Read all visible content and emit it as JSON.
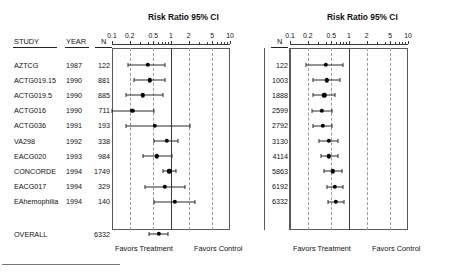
{
  "figure": {
    "kind": "forest-plot",
    "left_panel_title": "Risk Ratio  95%  CI",
    "right_panel_title": "Risk Ratio  95%  CI",
    "favors_treatment_label": "Favors Treatment",
    "favors_control_label": "Favors Control"
  },
  "columns": {
    "study_header": "STUDY",
    "year_header": "YEAR",
    "n_header": "N",
    "n_header_right": "N"
  },
  "axis": {
    "tick_labels": [
      "0.1",
      "0.2",
      "0.5",
      "1",
      "2",
      "5",
      "10"
    ],
    "tick_values": [
      0.1,
      0.2,
      0.5,
      1,
      2,
      5,
      10
    ],
    "scale": "log",
    "min": 0.1,
    "max": 10,
    "gridline_values": [
      0.2,
      0.5,
      2,
      5
    ],
    "null_value": 1,
    "minor_ticks": [
      0.3,
      0.4,
      0.6,
      0.7,
      0.8,
      0.9,
      3,
      4,
      6,
      7,
      8,
      9
    ]
  },
  "overall_label": "OVERALL",
  "chart_data": {
    "type": "forest",
    "title": "Risk Ratio  95%  CI",
    "xlabel": "Risk Ratio",
    "ylabel": "",
    "xscale": "log",
    "xlim": [
      0.1,
      10
    ],
    "grid": true,
    "legend": "none",
    "left_panel": {
      "name": "Individual trials",
      "columns": [
        "STUDY",
        "YEAR",
        "N"
      ],
      "rows": [
        {
          "study": "AZTCG",
          "year": "1987",
          "n": "122",
          "rr": 0.4,
          "lcl": 0.19,
          "ucl": 0.79
        },
        {
          "study": "ACTG019.15",
          "year": "1990",
          "n": "881",
          "rr": 0.44,
          "lcl": 0.24,
          "ucl": 0.8
        },
        {
          "study": "ACTG019.5",
          "year": "1990",
          "n": "885",
          "rr": 0.33,
          "lcl": 0.17,
          "ucl": 0.72
        },
        {
          "study": "ACTG016",
          "year": "1990",
          "n": "711",
          "rr": 0.22,
          "lcl": 0.1,
          "ucl": 0.52
        },
        {
          "study": "ACTG036",
          "year": "1991",
          "n": "193",
          "rr": 0.53,
          "lcl": 0.17,
          "ucl": 2.1
        },
        {
          "study": "VA298",
          "year": "1992",
          "n": "338",
          "rr": 0.85,
          "lcl": 0.52,
          "ucl": 1.3
        },
        {
          "study": "EACG020",
          "year": "1993",
          "n": "984",
          "rr": 0.58,
          "lcl": 0.33,
          "ucl": 1.05
        },
        {
          "study": "CONCORDE",
          "year": "1994",
          "n": "1749",
          "rr": 0.94,
          "lcl": 0.74,
          "ucl": 1.2
        },
        {
          "study": "EACG017",
          "year": "1994",
          "n": "329",
          "rr": 0.78,
          "lcl": 0.36,
          "ucl": 1.72
        },
        {
          "study": "EAhemophilia",
          "year": "1994",
          "n": "140",
          "rr": 1.16,
          "lcl": 0.52,
          "ucl": 2.6
        }
      ],
      "overall": {
        "study": "OVERALL",
        "year": "",
        "n": "6332",
        "rr": 0.62,
        "lcl": 0.43,
        "ucl": 0.88
      }
    },
    "right_panel": {
      "name": "Cumulative meta-analysis",
      "columns": [
        "N"
      ],
      "rows": [
        {
          "n": "122",
          "rr": 0.4,
          "lcl": 0.19,
          "ucl": 0.79
        },
        {
          "n": "1003",
          "rr": 0.42,
          "lcl": 0.25,
          "ucl": 0.7
        },
        {
          "n": "1888",
          "rr": 0.38,
          "lcl": 0.25,
          "ucl": 0.58
        },
        {
          "n": "2599",
          "rr": 0.35,
          "lcl": 0.24,
          "ucl": 0.52
        },
        {
          "n": "2792",
          "rr": 0.36,
          "lcl": 0.25,
          "ucl": 0.52
        },
        {
          "n": "3130",
          "rr": 0.45,
          "lcl": 0.31,
          "ucl": 0.65
        },
        {
          "n": "4114",
          "rr": 0.46,
          "lcl": 0.33,
          "ucl": 0.64
        },
        {
          "n": "5863",
          "rr": 0.53,
          "lcl": 0.37,
          "ucl": 0.75
        },
        {
          "n": "6192",
          "rr": 0.57,
          "lcl": 0.42,
          "ucl": 0.78
        },
        {
          "n": "6332",
          "rr": 0.6,
          "lcl": 0.44,
          "ucl": 0.82
        }
      ]
    }
  }
}
